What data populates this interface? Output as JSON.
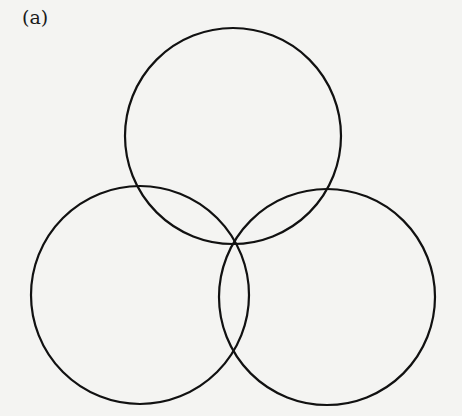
{
  "figure": {
    "label": "(a)",
    "stroke_color": "#111111",
    "background": "#f4f4f2",
    "circles": [
      {
        "name": "top",
        "cx": 233,
        "cy": 136,
        "r": 108
      },
      {
        "name": "bottom-left",
        "cx": 140,
        "cy": 295,
        "r": 109
      },
      {
        "name": "bottom-right",
        "cx": 327,
        "cy": 297,
        "r": 108
      }
    ]
  }
}
